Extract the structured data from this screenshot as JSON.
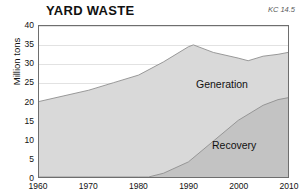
{
  "chart_data": {
    "type": "area",
    "title": "YARD WASTE",
    "annotation": "KC 14.5",
    "xlabel": "",
    "ylabel": "Million tons",
    "ylim": [
      0,
      40
    ],
    "xlim": [
      1960,
      2010
    ],
    "yticks": [
      0,
      5,
      10,
      15,
      20,
      25,
      30,
      35,
      40
    ],
    "xticks": [
      1960,
      1970,
      1980,
      1990,
      2000,
      2010
    ],
    "grid": true,
    "legend_position": "inline-annotations",
    "stacked": false,
    "series": [
      {
        "name": "Generation",
        "color": "#d9d9d9",
        "x": [
          1960,
          1965,
          1970,
          1975,
          1980,
          1985,
          1990,
          1991,
          1995,
          2000,
          2002,
          2005,
          2008,
          2010
        ],
        "values": [
          20.0,
          21.5,
          23.0,
          25.0,
          27.0,
          30.5,
          34.5,
          35.0,
          33.0,
          31.5,
          30.8,
          32.0,
          32.5,
          33.0
        ]
      },
      {
        "name": "Recovery",
        "color": "#c3c3c3",
        "x": [
          1960,
          1970,
          1980,
          1982,
          1985,
          1990,
          1995,
          2000,
          2005,
          2008,
          2010
        ],
        "values": [
          0.0,
          0.0,
          0.0,
          0.0,
          1.0,
          4.0,
          9.5,
          15.0,
          19.0,
          20.5,
          21.0
        ]
      }
    ]
  },
  "axis": {
    "ytick_labels": [
      "40",
      "35",
      "30",
      "25",
      "20",
      "15",
      "10",
      "5",
      "0"
    ],
    "xtick_labels": [
      "1960",
      "1970",
      "1980",
      "1990",
      "2000",
      "2010"
    ]
  },
  "labels": {
    "generation": "Generation",
    "recovery": "Recovery"
  },
  "colors": {
    "generation_fill": "#d9d9d9",
    "recovery_fill": "#c3c3c3",
    "frame": "#6e6e6e",
    "grid": "#e2e2e2",
    "text": "#111111"
  }
}
